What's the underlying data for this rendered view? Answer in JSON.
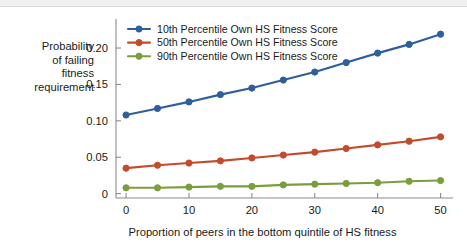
{
  "chart_data": {
    "type": "line",
    "title": "",
    "xlabel": "Proportion of peers in the bottom quintile of HS fitness",
    "ylabel": "Probability\nof failing\nfitness\nrequirement",
    "ylabel_lines": [
      "Probability",
      "of failing",
      "fitness",
      "requirement"
    ],
    "x": [
      0,
      5,
      10,
      15,
      20,
      25,
      30,
      35,
      40,
      45,
      50
    ],
    "xlim": [
      -1.6,
      51.5
    ],
    "ylim": [
      -0.006,
      0.233
    ],
    "xticks": [
      0,
      10,
      20,
      30,
      40,
      50
    ],
    "xtick_labels": [
      "0",
      "10",
      "20",
      "30",
      "40",
      "50"
    ],
    "yticks": [
      0,
      0.05,
      0.1,
      0.15,
      0.2
    ],
    "ytick_labels": [
      "0",
      "0.05",
      "0.10",
      "0.15",
      "0.20"
    ],
    "grid": false,
    "legend_position": "top-left inside axes",
    "marker": "circle",
    "series": [
      {
        "name": "10th Percentile Own HS Fitness Score",
        "color": "#2E5E9C",
        "values": [
          0.108,
          0.117,
          0.126,
          0.136,
          0.145,
          0.156,
          0.167,
          0.18,
          0.193,
          0.205,
          0.219
        ]
      },
      {
        "name": "50th Percentile Own HS Fitness Score",
        "color": "#C44A2C",
        "values": [
          0.035,
          0.039,
          0.042,
          0.045,
          0.049,
          0.053,
          0.057,
          0.062,
          0.067,
          0.072,
          0.078
        ]
      },
      {
        "name": "90th Percentile Own HS Fitness Score",
        "color": "#7A9E3D",
        "values": [
          0.008,
          0.008,
          0.009,
          0.01,
          0.01,
          0.012,
          0.013,
          0.014,
          0.015,
          0.017,
          0.018
        ]
      }
    ]
  },
  "colors": {
    "axis": "#8c8c8c",
    "text": "#1a1a1a",
    "background": "#ffffff",
    "series_blue": "#2E5E9C",
    "series_red": "#C44A2C",
    "series_green": "#7A9E3D"
  }
}
